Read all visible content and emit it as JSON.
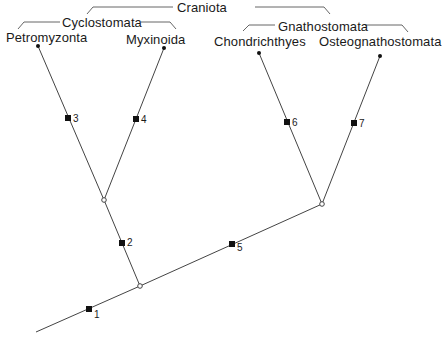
{
  "diagram": {
    "type": "cladogram",
    "groups": {
      "craniota": "Craniota",
      "cyclostomata": "Cyclostomata",
      "gnathostomata": "Gnathostomata"
    },
    "taxa": [
      {
        "id": "petromyzonta",
        "label": "Petromyzonta"
      },
      {
        "id": "myxinoida",
        "label": "Myxinoida"
      },
      {
        "id": "chondrichthyes",
        "label": "Chondrichthyes"
      },
      {
        "id": "osteognathostomata",
        "label": "Osteognathostomata"
      }
    ],
    "characters": [
      {
        "label": "1"
      },
      {
        "label": "2"
      },
      {
        "label": "3"
      },
      {
        "label": "4"
      },
      {
        "label": "5"
      },
      {
        "label": "6"
      },
      {
        "label": "7"
      }
    ],
    "colors": {
      "line": "#444444",
      "marker": "#111111",
      "text": "#1a1a1a",
      "background": "#ffffff"
    }
  }
}
